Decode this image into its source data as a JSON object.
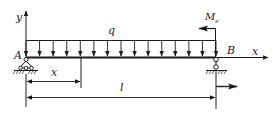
{
  "diagram": {
    "type": "simply-supported-beam",
    "labels": {
      "y_axis": "y",
      "x_axis": "x",
      "load": "q",
      "support_left": "A",
      "support_right": "B",
      "moment_main": "M",
      "moment_sub": "e",
      "section_distance": "x",
      "span_length": "l"
    },
    "colors": {
      "line": "#1a1a1a",
      "background": "#ffffff"
    },
    "geometry": {
      "beam_y": 57,
      "a_x": 26,
      "b_x": 216,
      "load_top_y": 40,
      "load_arrow_count": 15,
      "section_x": 81,
      "dim_x_y": 81,
      "dim_l_y": 97
    }
  }
}
